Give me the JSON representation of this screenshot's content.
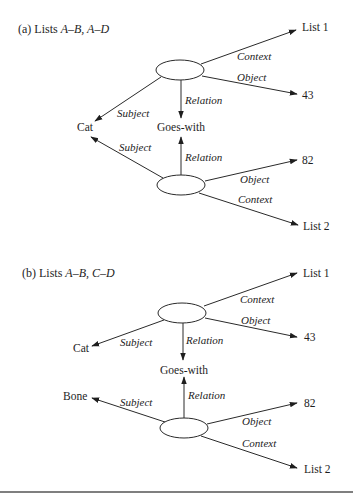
{
  "panels": {
    "a": {
      "title": {
        "prefix": "(a) Lists ",
        "lists": "A–B, A–D"
      },
      "nodes": {
        "cat": "Cat",
        "goes_with": "Goes-with",
        "list1": "List 1",
        "value43": "43",
        "value82": "82",
        "list2": "List 2"
      },
      "propositions": [
        {
          "context": "Context",
          "object": "Object",
          "relation": "Relation",
          "subject": "Subject"
        },
        {
          "context": "Context",
          "object": "Object",
          "relation": "Relation",
          "subject": "Subject"
        }
      ]
    },
    "b": {
      "title": {
        "prefix": "(b) Lists ",
        "lists": "A–B, C–D"
      },
      "nodes": {
        "cat": "Cat",
        "bone": "Bone",
        "goes_with": "Goes-with",
        "list1": "List 1",
        "value43": "43",
        "value82": "82",
        "list2": "List 2"
      },
      "propositions": [
        {
          "context": "Context",
          "object": "Object",
          "relation": "Relation",
          "subject": "Subject"
        },
        {
          "context": "Context",
          "object": "Object",
          "relation": "Relation",
          "subject": "Subject"
        }
      ]
    }
  },
  "colors": {
    "ink": "#1e1e1e",
    "line": "#2a2a2a",
    "rule": "#555555"
  }
}
